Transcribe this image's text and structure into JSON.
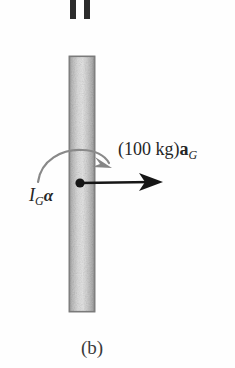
{
  "figure": {
    "caption": "(b)",
    "background_color": "#fefefe",
    "ink_color": "#262626",
    "rod": {
      "name": "vertical-rod",
      "fill_color": "#c9c9c9",
      "edge_color": "#8e8e8e",
      "highlight_color": "#e2e2e2",
      "x": 69,
      "y": 56,
      "width": 26,
      "height": 256
    },
    "top_bars": {
      "name": "cropped-bars-above",
      "color": "#2b2b2b",
      "count": 2,
      "bars": [
        {
          "x": 70,
          "y": 0,
          "width": 6,
          "height": 19
        },
        {
          "x": 84,
          "y": 0,
          "width": 6,
          "height": 19
        }
      ]
    },
    "mass_center": {
      "name": "center-of-mass-dot",
      "color": "#1a1a1a",
      "cx": 80,
      "cy": 183,
      "r": 4.5
    },
    "vectors": [
      {
        "name": "acceleration-vector",
        "kind": "straight-arrow",
        "color": "#1a1a1a",
        "from": [
          80,
          183
        ],
        "to": [
          163,
          182
        ],
        "label": "(100 kg)aG",
        "label_parts": {
          "prefix": "(100 kg)",
          "symbol": "a",
          "subscript": "G"
        }
      },
      {
        "name": "couple-moment-arc",
        "kind": "curved-arrow",
        "color": "#8a8a8a",
        "sense": "clockwise",
        "start": [
          38,
          181
        ],
        "end": [
          108,
          165
        ],
        "label": "IGα",
        "label_parts": {
          "symbol": "I",
          "subscript": "G",
          "suffix": "α"
        }
      }
    ]
  }
}
